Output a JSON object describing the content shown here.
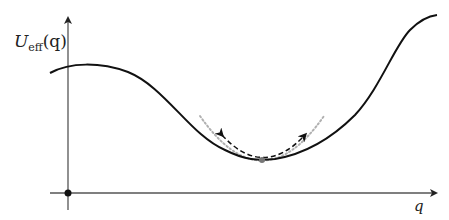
{
  "diagram": {
    "type": "potential-energy-curve",
    "y_axis_label": {
      "main": "U",
      "subscript": "eff",
      "argument": "(q)"
    },
    "x_axis_label": "q",
    "origin_marker": "filled-dot",
    "minimum_marker": "gray-dot",
    "harmonic_approximation": "gray dotted parabola around minimum",
    "oscillation_arrow": "dashed double-headed arc",
    "colors": {
      "curve": "#111111",
      "axes": "#555555",
      "approximation": "#b0b0b0",
      "minimum_dot": "#777777"
    }
  }
}
